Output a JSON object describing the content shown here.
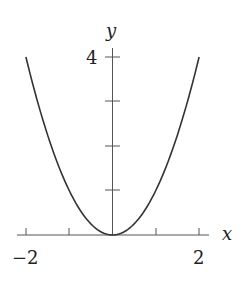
{
  "chart_data": {
    "type": "line",
    "title": "",
    "function": "y = x^2",
    "xlabel": "x",
    "ylabel": "y",
    "xlim": [
      -2,
      2
    ],
    "ylim": [
      0,
      4
    ],
    "x_ticks": [
      -2,
      -1,
      0,
      1,
      2
    ],
    "x_tick_labels": [
      "−2",
      "2"
    ],
    "y_ticks": [
      1,
      2,
      3,
      4
    ],
    "y_tick_labels": [
      "4"
    ],
    "grid": false,
    "series": [
      {
        "name": "y = x^2",
        "x": [
          -2,
          -1.5,
          -1,
          -0.5,
          0,
          0.5,
          1,
          1.5,
          2
        ],
        "y": [
          4,
          2.25,
          1,
          0.25,
          0,
          0.25,
          1,
          2.25,
          4
        ]
      }
    ],
    "colors": {
      "curve": "#333333",
      "axis": "#555555"
    }
  }
}
